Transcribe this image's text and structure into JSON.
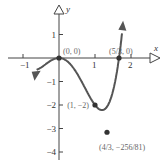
{
  "graph": {
    "x_axis_label": "x",
    "y_axis_label": "y",
    "x_ticks": [
      {
        "value": -1,
        "label": "−1"
      },
      {
        "value": 1,
        "label": "1"
      },
      {
        "value": 2,
        "label": "2"
      }
    ],
    "y_ticks": [
      {
        "value": 1,
        "label": "1"
      },
      {
        "value": -1,
        "label": "−1"
      },
      {
        "value": -2,
        "label": "−2"
      },
      {
        "value": -3,
        "label": "−3"
      },
      {
        "value": -4,
        "label": "−4"
      }
    ],
    "points": [
      {
        "x": 0,
        "y": 0,
        "label": "(0, 0)"
      },
      {
        "x": 1.6667,
        "y": 0,
        "label": "(5/3, 0)"
      },
      {
        "x": 1,
        "y": -2,
        "label": "(1, −2)"
      },
      {
        "x": 1.3333,
        "y": -3.1605,
        "label": "(4/3, −256/81)"
      }
    ],
    "curve_color": "#555555",
    "point_color": "#333333"
  }
}
